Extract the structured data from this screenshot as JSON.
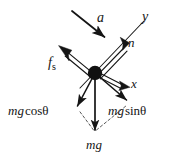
{
  "diagram": {
    "type": "free-body-force-diagram",
    "stroke_color": "#151515",
    "background_color": "#ffffff",
    "particle": {
      "name": "block-particle",
      "cx": 95,
      "cy": 73,
      "r": 7.2
    },
    "axes": [
      {
        "name": "y-axis",
        "label": "y",
        "x1": 80,
        "y1": 88,
        "x2": 144,
        "y2": 21,
        "style": "thin-line",
        "arrow": false
      },
      {
        "name": "x-axis",
        "label": "x",
        "x1": 95,
        "y1": 73,
        "x2": 137,
        "y2": 90,
        "style": "thin-line",
        "arrow": false
      }
    ],
    "vectors": [
      {
        "name": "acceleration-vector",
        "label": "a",
        "x1": 72,
        "y1": 11,
        "x2": 106,
        "y2": 38,
        "style": "single-line",
        "direction": "down-right"
      },
      {
        "name": "normal-force-vector",
        "label": "n",
        "x1": 95,
        "y1": 73,
        "x2": 127,
        "y2": 40,
        "style": "double-line",
        "direction": "up-right"
      },
      {
        "name": "static-friction-vector",
        "label": "f_s",
        "x1": 95,
        "y1": 73,
        "x2": 60,
        "y2": 46,
        "style": "double-line",
        "direction": "up-left"
      },
      {
        "name": "mg-cos-theta-vector",
        "label": "mg cosθ",
        "x1": 95,
        "y1": 73,
        "x2": 76,
        "y2": 109,
        "style": "single-line",
        "direction": "down-left"
      },
      {
        "name": "mg-sin-theta-vector",
        "label": "mg sinθ",
        "x1": 95,
        "y1": 73,
        "x2": 129,
        "y2": 103,
        "style": "single-line",
        "direction": "down-right"
      },
      {
        "name": "weight-vector",
        "label": "mg",
        "x1": 95,
        "y1": 73,
        "x2": 95,
        "y2": 134,
        "style": "single-line",
        "direction": "down"
      }
    ],
    "construction_lines": [
      {
        "name": "dashed-line-to-mg-cos",
        "x1": 94,
        "y1": 131,
        "x2": 79,
        "y2": 110,
        "style": "dashed"
      },
      {
        "name": "dashed-line-to-mg-sin",
        "x1": 96,
        "y1": 131,
        "x2": 127,
        "y2": 105,
        "style": "dashed"
      }
    ],
    "labels": {
      "acceleration": "a",
      "y_axis": "y",
      "normal_force": "n",
      "friction_symbol": "f",
      "friction_subscript": "s",
      "x_axis": "x",
      "mg_cos_mg": "mg",
      "mg_cos_fn": "cos",
      "mg_cos_theta": "θ",
      "mg_sin_mg": "mg",
      "mg_sin_fn": "sin",
      "mg_sin_theta": "θ",
      "weight": "mg"
    }
  }
}
